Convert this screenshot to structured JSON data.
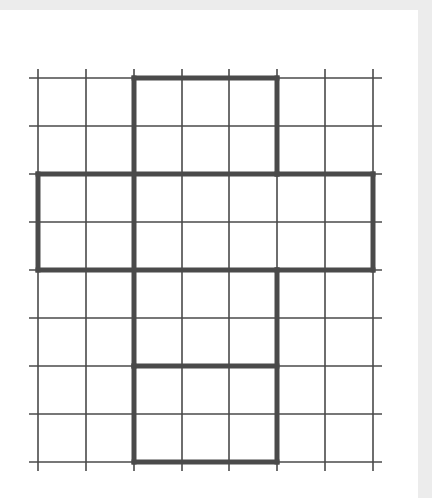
{
  "document": {
    "kind": "scanned-worksheet-figure",
    "title": "Grid with bold outlined cross-shaped polygon",
    "background_color": "#ffffff",
    "scan_border_color": "#ececec"
  },
  "figure": {
    "name": "grid-polygon-figure",
    "grid": {
      "columns": 7,
      "rows": 8,
      "cell_size_px": 47.8,
      "line_color": "#4a4a4a",
      "line_width_px": 1.6,
      "tick_overhang_px": 9,
      "x_positions": [
        38,
        86,
        134,
        182,
        229,
        277,
        325,
        373
      ],
      "y_positions": [
        78,
        126,
        174,
        222,
        270,
        318,
        366,
        414,
        462
      ]
    },
    "outline": {
      "color": "#4a4a4a",
      "line_width_px": 5,
      "description": "Bold cross / plus-shaped polygon overlaid on the grid",
      "vertices": [
        [
          134,
          78
        ],
        [
          277,
          78
        ],
        [
          277,
          174
        ],
        [
          373,
          174
        ],
        [
          373,
          270
        ],
        [
          277,
          270
        ],
        [
          277,
          462
        ],
        [
          134,
          462
        ],
        [
          134,
          366
        ],
        [
          277,
          366
        ],
        [
          277,
          270
        ],
        [
          134,
          270
        ],
        [
          38,
          270
        ],
        [
          38,
          174
        ],
        [
          134,
          174
        ]
      ],
      "segments": [
        {
          "name": "top-edge",
          "from": [
            134,
            78
          ],
          "to": [
            277,
            78
          ]
        },
        {
          "name": "upper-right-vertical",
          "from": [
            277,
            78
          ],
          "to": [
            277,
            174
          ]
        },
        {
          "name": "right-arm-top",
          "from": [
            277,
            174
          ],
          "to": [
            373,
            174
          ]
        },
        {
          "name": "right-arm-end",
          "from": [
            373,
            174
          ],
          "to": [
            373,
            270
          ]
        },
        {
          "name": "right-arm-bottom",
          "from": [
            277,
            270
          ],
          "to": [
            373,
            270
          ]
        },
        {
          "name": "lower-right-vertical",
          "from": [
            277,
            270
          ],
          "to": [
            277,
            462
          ]
        },
        {
          "name": "bottom-edge",
          "from": [
            134,
            462
          ],
          "to": [
            277,
            462
          ]
        },
        {
          "name": "lower-left-vertical",
          "from": [
            134,
            366
          ],
          "to": [
            134,
            462
          ]
        },
        {
          "name": "inner-shelf",
          "from": [
            134,
            366
          ],
          "to": [
            277,
            366
          ]
        },
        {
          "name": "left-arm-bottom",
          "from": [
            38,
            270
          ],
          "to": [
            277,
            270
          ]
        },
        {
          "name": "left-arm-end",
          "from": [
            38,
            174
          ],
          "to": [
            38,
            270
          ]
        },
        {
          "name": "left-arm-top",
          "from": [
            38,
            174
          ],
          "to": [
            277,
            174
          ]
        },
        {
          "name": "upper-left-vertical",
          "from": [
            134,
            78
          ],
          "to": [
            134,
            366
          ]
        }
      ]
    }
  }
}
